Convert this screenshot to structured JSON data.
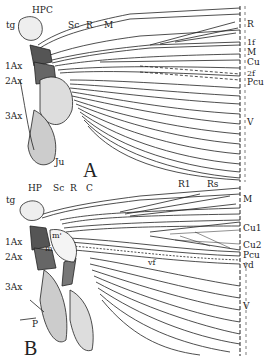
{
  "figure": {
    "panels": [
      {
        "id": "A",
        "label": "A",
        "left_labels": {
          "tg": "tg",
          "HP": "HP",
          "Ax1": "1Ax",
          "Ax2": "2Ax",
          "Ax3": "3Ax",
          "Ju": "Ju"
        },
        "top_labels": {
          "C": "C",
          "Sc": "Sc",
          "R": "R",
          "M": "M"
        },
        "right_labels": [
          "R",
          "1f",
          "M",
          "Cu",
          "2f",
          "Pcu",
          "V"
        ]
      },
      {
        "id": "B",
        "label": "B",
        "left_labels": {
          "tg": "tg",
          "HP": "HP",
          "Ax1": "1Ax",
          "Ax2": "2Ax",
          "Ax3": "3Ax",
          "m1": "m'",
          "m2": "m",
          "P": "P"
        },
        "top_labels": {
          "Sc": "Sc",
          "R": "R",
          "C": "C",
          "R1": "R1",
          "Rs": "Rs"
        },
        "inner_labels": {
          "vf": "vf"
        },
        "right_labels": [
          "M",
          "Cu1",
          "Cu2",
          "Pcu",
          "vd",
          "V"
        ]
      }
    ]
  },
  "colors": {
    "ink": "#222222",
    "shade": "#555555",
    "stipple": "#bbbbbb",
    "paper": "#ffffff"
  }
}
